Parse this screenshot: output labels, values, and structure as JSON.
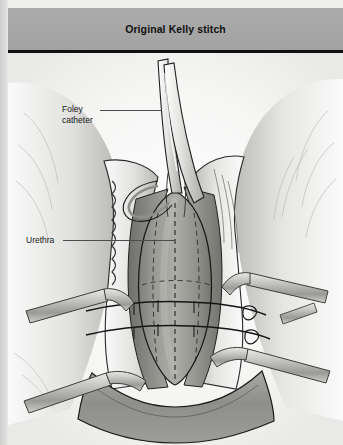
{
  "page": {
    "title": "Original Kelly stitch",
    "background_color": "#f2f2f0",
    "header_color": "#a6a6a6",
    "rule_color": "#111111"
  },
  "labels": [
    {
      "id": "foley-catheter",
      "text": "Foley\ncatheter",
      "x": 62,
      "y": 104,
      "leader_x": 100,
      "leader_y": 110,
      "leader_w": 62
    },
    {
      "id": "urethra",
      "text": "Urethra",
      "x": 26,
      "y": 235,
      "leader_x": 63,
      "leader_y": 240,
      "leader_w": 112
    }
  ],
  "illustration": {
    "type": "medical-line-drawing",
    "subject": "Kelly plication stitch at the bladder neck / urethrovesical junction",
    "view": "surgical field, anterior vaginal wall opened, retracted",
    "palette": {
      "tissue_light": "#f3f3f2",
      "tissue_mid": "#c9c9c7",
      "tissue_dark": "#8f8f8d",
      "tissue_deep": "#74746f",
      "bladder_base": "#9c9c98",
      "instrument_fill": "#bdbdbb",
      "instrument_edge": "#4d4d4b",
      "outline": "#1b1b1b",
      "suture_dash": "#2a2a2a"
    },
    "elements": [
      {
        "name": "foley-catheter",
        "kind": "tube",
        "note": "two parallel catheter tubes running up through the incision apex"
      },
      {
        "name": "urethra",
        "kind": "structure",
        "note": "urethral channel at the midline below the catheter"
      },
      {
        "name": "bladder-neck-bulge",
        "kind": "structure",
        "note": "central rounded paravesical bulge"
      },
      {
        "name": "vaginal-wall-flap-left",
        "kind": "tissue-flap",
        "note": "scalloped cut edge, retracted laterally"
      },
      {
        "name": "vaginal-wall-flap-right",
        "kind": "tissue-flap",
        "note": "hatched cut edge, retracted laterally"
      },
      {
        "name": "retractor-upper-left",
        "kind": "instrument"
      },
      {
        "name": "retractor-lower-left",
        "kind": "instrument"
      },
      {
        "name": "retractor-upper-right",
        "kind": "instrument"
      },
      {
        "name": "retractor-lower-right",
        "kind": "instrument"
      },
      {
        "name": "suture-midline-dashed",
        "kind": "suture",
        "note": "vertical dashed midline marking"
      },
      {
        "name": "suture-stitch-upper",
        "kind": "suture",
        "note": "upper horizontal plication stitch"
      },
      {
        "name": "suture-stitch-lower",
        "kind": "suture",
        "note": "lower horizontal plication stitch"
      },
      {
        "name": "suture-outline-dashed",
        "kind": "suture",
        "note": "dashed oval outline of plicated region"
      },
      {
        "name": "perineal-tissue-band",
        "kind": "tissue",
        "note": "darker transverse tissue band at the bottom"
      }
    ]
  },
  "ghost_text": [
    {
      "text": "the dissection is carried laterally",
      "x": 30,
      "y": 404
    },
    {
      "text": "of the urethrovesical junction",
      "x": 178,
      "y": 404
    },
    {
      "text": "sutures are placed in the",
      "x": 26,
      "y": 416
    },
    {
      "text": "periurethral fascia at the level of",
      "x": 150,
      "y": 416
    },
    {
      "text": "the bladder neck and tied",
      "x": 48,
      "y": 428
    }
  ]
}
